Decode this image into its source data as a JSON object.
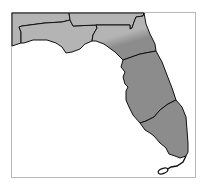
{
  "map": {
    "subject": "Florida",
    "regions": [
      {
        "id": "northwest-panhandle-north",
        "fill": "#b4b4b4"
      },
      {
        "id": "northwest-panhandle-coast",
        "fill": "#b4b4b4"
      },
      {
        "id": "north-central",
        "fill": "#b4b4b4"
      },
      {
        "id": "north-central-transition",
        "fill": "#9a9a9a"
      },
      {
        "id": "central",
        "fill": "#8c8c8c"
      },
      {
        "id": "south",
        "fill": "#8c8c8c"
      },
      {
        "id": "keys",
        "fill": "#8c8c8c"
      }
    ],
    "colors": {
      "light_region": "#b4b4b4",
      "dark_region": "#8c8c8c",
      "border": "#111111",
      "frame": "#b8b8b8",
      "water": "#ffffff"
    }
  }
}
